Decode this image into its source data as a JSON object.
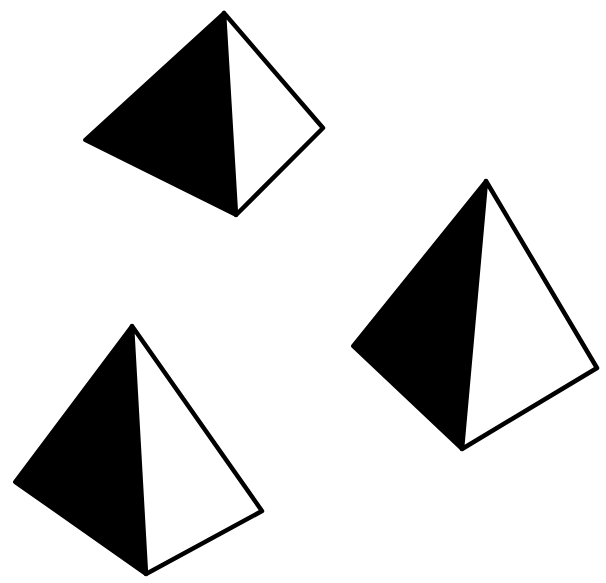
{
  "canvas": {
    "width": 606,
    "height": 583,
    "background": "#ffffff"
  },
  "colors": {
    "ink": "#000000",
    "light_face": "#ffffff"
  },
  "pyramids": [
    {
      "name": "top-pyramid",
      "apex": [
        224,
        13
      ],
      "left": [
        85,
        140
      ],
      "bottom": [
        236,
        215
      ],
      "right": [
        323,
        128
      ]
    },
    {
      "name": "right-pyramid",
      "apex": [
        486,
        181
      ],
      "left": [
        353,
        346
      ],
      "bottom": [
        462,
        449
      ],
      "right": [
        597,
        368
      ]
    },
    {
      "name": "bottom-left-pyramid",
      "apex": [
        132,
        326
      ],
      "left": [
        15,
        482
      ],
      "bottom": [
        146,
        574
      ],
      "right": [
        262,
        511
      ]
    }
  ]
}
